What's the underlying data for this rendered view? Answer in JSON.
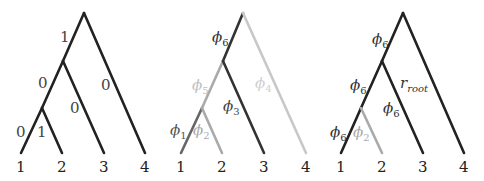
{
  "colors": {
    "dark": "#222222",
    "mid": "#555555",
    "light": "#aaaaaa",
    "faint": "#c8c8c8"
  },
  "leaves": [
    "1",
    "2",
    "3",
    "4"
  ],
  "trees": [
    {
      "name": "binary-labels-tree",
      "edge_labels": {
        "root_left": "1",
        "mid_left": "0",
        "leaf1": "0",
        "leaf2": "1",
        "leaf3": "0",
        "leaf4": "0"
      }
    },
    {
      "name": "phi-tree",
      "edge_labels": {
        "root_left": {
          "base": "ϕ",
          "sub": "6"
        },
        "mid_left": {
          "base": "ϕ",
          "sub": "5"
        },
        "leaf1": {
          "base": "ϕ",
          "sub": "1"
        },
        "leaf2": {
          "base": "ϕ",
          "sub": "2"
        },
        "leaf3": {
          "base": "ϕ",
          "sub": "3"
        },
        "leaf4": {
          "base": "ϕ",
          "sub": "4"
        }
      }
    },
    {
      "name": "phi6-root-tree",
      "edge_labels": {
        "root_left": {
          "base": "ϕ",
          "sub": "6"
        },
        "mid_left": {
          "base": "ϕ",
          "sub": "6"
        },
        "leaf1": {
          "base": "ϕ",
          "sub": "6"
        },
        "leaf2": {
          "base": "ϕ",
          "sub": "2"
        },
        "leaf3": {
          "base": "ϕ",
          "sub": "6"
        },
        "leaf4": {
          "base": "r",
          "sub": "root"
        }
      }
    }
  ]
}
